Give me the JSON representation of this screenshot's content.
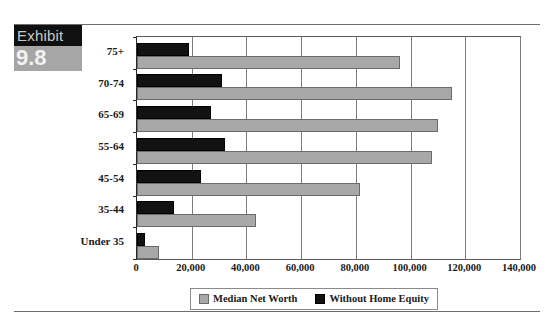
{
  "exhibit": {
    "word": "Exhibit",
    "number": "9.8"
  },
  "legend": {
    "items": [
      {
        "label": "Median Net Worth",
        "color": "#a8a8a8",
        "swatch": "square-gray-swatch"
      },
      {
        "label": "Without Home Equity",
        "color": "#121212",
        "swatch": "square-black-swatch"
      }
    ]
  },
  "chart_data": {
    "type": "bar",
    "orientation": "horizontal",
    "title": "",
    "xlabel": "",
    "ylabel": "",
    "categories": [
      "Under 35",
      "35-44",
      "45-54",
      "55-64",
      "65-69",
      "70-74",
      "75+"
    ],
    "series": [
      {
        "name": "Median Net Worth",
        "color": "#a8a8a8",
        "values": [
          8000,
          43500,
          81500,
          108000,
          110000,
          115000,
          96000
        ]
      },
      {
        "name": "Without Home Equity",
        "color": "#121212",
        "values": [
          3000,
          13500,
          23500,
          32000,
          27000,
          31000,
          19000
        ]
      }
    ],
    "xlim": [
      0,
      140000
    ],
    "xticks": [
      0,
      20000,
      40000,
      60000,
      80000,
      100000,
      120000,
      140000
    ],
    "xticklabels": [
      "0",
      "20,000",
      "40,000",
      "60,000",
      "80,000",
      "100,000",
      "120,000",
      "140,000"
    ],
    "grid": "vertical",
    "legend_position": "bottom"
  }
}
